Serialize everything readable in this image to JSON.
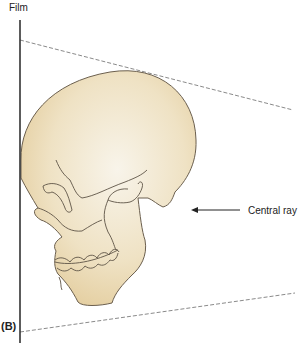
{
  "labels": {
    "film": "Film",
    "central_ray": "Central ray",
    "panel": "(B)"
  },
  "colors": {
    "skull_fill_light": "#f6f1e4",
    "skull_fill_dark": "#e6d2a6",
    "outline": "#5e5446",
    "film_line": "#333333",
    "beam_line": "#8a8a8a"
  }
}
